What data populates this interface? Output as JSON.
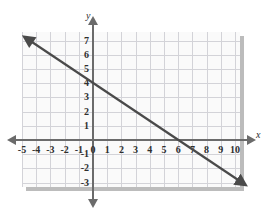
{
  "chart_data": {
    "type": "line",
    "title": "",
    "xlabel": "x",
    "ylabel": "y",
    "xlim": [
      -5,
      10
    ],
    "ylim": [
      -3,
      7
    ],
    "grid": true,
    "legend": null,
    "x_ticks": [
      "-5",
      "-4",
      "-3",
      "-2",
      "-1",
      "0",
      "1",
      "2",
      "3",
      "4",
      "5",
      "6",
      "7",
      "8",
      "9",
      "10"
    ],
    "x_tick_values": [
      -5,
      -4,
      -3,
      -2,
      -1,
      0,
      1,
      2,
      3,
      4,
      5,
      6,
      7,
      8,
      9,
      10
    ],
    "y_ticks": [
      "7",
      "6",
      "5",
      "4",
      "3",
      "2",
      "1",
      "-1",
      "-2",
      "-3"
    ],
    "y_tick_values": [
      7,
      6,
      5,
      4,
      3,
      2,
      1,
      -1,
      -2,
      -3
    ],
    "series": [
      {
        "name": "line",
        "equation": "y = -2/3 x + 4",
        "slope": -0.6667,
        "y_intercept": 4,
        "x_intercept": 6,
        "arrows": "both",
        "color": "#4a4a4a",
        "points": [
          {
            "x": -4.3,
            "y": 6.9
          },
          {
            "x": 0,
            "y": 4
          },
          {
            "x": 6,
            "y": 0
          },
          {
            "x": 10.2,
            "y": -2.8
          }
        ]
      }
    ]
  },
  "colors": {
    "panel_background": "#fafafa",
    "grid": "#d3d3d8",
    "axis": "#6b6b6b",
    "line": "#4a4a4a",
    "shadow": "#bcbcbc",
    "tick_text": "#2e2e2e"
  }
}
